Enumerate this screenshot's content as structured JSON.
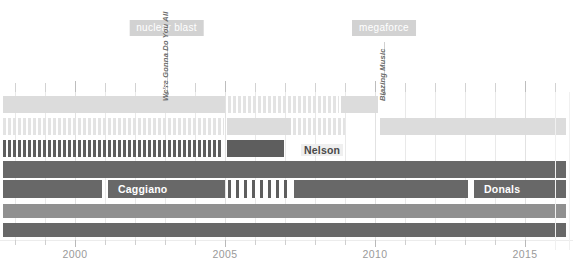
{
  "chart_data": {
    "type": "bar",
    "orientation": "horizontal-timeline",
    "title": "",
    "subtitle": "",
    "xlabel": "",
    "ylabel": "",
    "xlim": [
      1997.5,
      2016.6
    ],
    "grid": true,
    "grid_axis": "x",
    "legend": "none",
    "axis": {
      "tick_labels": [
        "2000",
        "2005",
        "2010",
        "2015"
      ],
      "tick_values": [
        2000,
        2005,
        2010,
        2015
      ],
      "minor_tick_values": [
        1998,
        1999,
        2001,
        2002,
        2003,
        2004,
        2006,
        2007,
        2008,
        2009,
        2011,
        2012,
        2013,
        2014,
        2016
      ],
      "label_color": "#9a9a9a"
    },
    "colors": {
      "light": "#dcdcdc",
      "mid": "#b9b9b9",
      "grey": "#909090",
      "dark": "#5e5e5e",
      "badge": "#d2d2d2",
      "grid": "#e9e9e9",
      "background": "#ffffff"
    },
    "rows": [
      {
        "index": 0,
        "label": "",
        "segments": [
          {
            "start": 1997.6,
            "end": 2005.0,
            "fill": "solid-light",
            "label": ""
          },
          {
            "start": 2005.1,
            "end": 2008.8,
            "fill": "hatch-light",
            "label": ""
          },
          {
            "start": 2008.85,
            "end": 2010.1,
            "fill": "solid-light",
            "label": ""
          }
        ]
      },
      {
        "index": 1,
        "label": "",
        "segments": [
          {
            "start": 1997.6,
            "end": 2004.95,
            "fill": "hatch-light",
            "label": ""
          },
          {
            "start": 2005.05,
            "end": 2007.2,
            "fill": "solid-light",
            "label": ""
          },
          {
            "start": 2007.25,
            "end": 2009.0,
            "fill": "hatch-light",
            "label": ""
          },
          {
            "start": 2010.15,
            "end": 2016.35,
            "fill": "solid-light",
            "label": ""
          }
        ]
      },
      {
        "index": 2,
        "label": "Nelson",
        "segments": [
          {
            "start": 1997.6,
            "end": 2004.9,
            "fill": "hatch-dark",
            "label": ""
          },
          {
            "start": 2005.05,
            "end": 2006.95,
            "fill": "solid-dark",
            "label": ""
          },
          {
            "start": 2007.2,
            "end": 2009.0,
            "fill": "none",
            "label": "Nelson"
          }
        ]
      },
      {
        "index": 3,
        "label": "",
        "segments": [
          {
            "start": 1997.6,
            "end": 2016.35,
            "fill": "solid-dark2",
            "label": ""
          }
        ]
      },
      {
        "index": 4,
        "label": "Caggiano / Donals",
        "segments": [
          {
            "start": 1997.6,
            "end": 2000.9,
            "fill": "solid-dark2",
            "label": ""
          },
          {
            "start": 2001.1,
            "end": 2005.0,
            "fill": "solid-dark2",
            "label": "Caggiano"
          },
          {
            "start": 2005.1,
            "end": 2007.2,
            "fill": "hatch-dark-wide",
            "label": ""
          },
          {
            "start": 2007.3,
            "end": 2013.1,
            "fill": "solid-dark2",
            "label": ""
          },
          {
            "start": 2013.3,
            "end": 2016.35,
            "fill": "solid-dark2",
            "label": "Donals"
          }
        ]
      },
      {
        "index": 5,
        "label": "",
        "segments": [
          {
            "start": 1997.6,
            "end": 2016.35,
            "fill": "solid-grey",
            "label": ""
          }
        ]
      },
      {
        "index": 6,
        "label": "",
        "segments": [
          {
            "start": 1997.6,
            "end": 2016.35,
            "fill": "solid-dark2",
            "label": ""
          }
        ]
      }
    ],
    "annotations": [
      {
        "badge": "nuclear blast",
        "event_label": "We're Gonna Do You All",
        "x": 2003.05,
        "badge_x": 2003.05
      },
      {
        "badge": "megaforce",
        "event_label": "Blazing Music",
        "x": 2010.3,
        "badge_x": 2010.3
      }
    ]
  }
}
